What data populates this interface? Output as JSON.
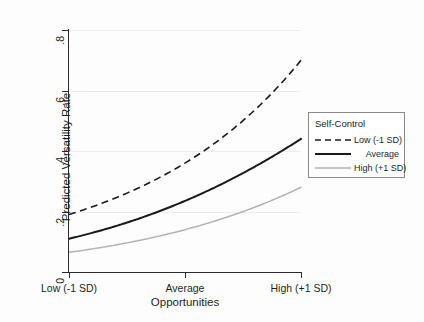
{
  "chart_data": {
    "type": "line",
    "title": "",
    "xlabel": "Opportunities",
    "ylabel": "Predicted Versatility Rate",
    "categories": [
      "Low (-1 SD)",
      "Average",
      "High (+1 SD)"
    ],
    "x": [
      0,
      1,
      2
    ],
    "xlim": [
      0,
      2
    ],
    "ylim": [
      0,
      0.8
    ],
    "yticks": [
      0,
      0.2,
      0.4,
      0.6,
      0.8
    ],
    "ytick_labels": [
      "0",
      ".2",
      ".4",
      ".6",
      ".8"
    ],
    "xtick_labels": [
      "Low (-1 SD)",
      "Average",
      "High (+1 SD)"
    ],
    "grid": "horizontal",
    "legend_position": "right-middle",
    "legend_title": "Self-Control",
    "series": [
      {
        "name": "Low (-1 SD)",
        "style": "dashed",
        "color": "#1a1a1a",
        "width": 1.6,
        "values": [
          0.19,
          0.36,
          0.7
        ]
      },
      {
        "name": "Average",
        "style": "solid",
        "color": "#1a1a1a",
        "width": 2.0,
        "values": [
          0.11,
          0.235,
          0.44
        ]
      },
      {
        "name": "High (+1 SD)",
        "style": "solid",
        "color": "#b3b3b3",
        "width": 1.5,
        "values": [
          0.065,
          0.14,
          0.28
        ]
      }
    ]
  },
  "axes": {
    "y_label": "Predicted Versatility Rate",
    "x_label": "Opportunities",
    "y_ticks": [
      {
        "label": ".8",
        "value": 0.8
      },
      {
        "label": ".6",
        "value": 0.6
      },
      {
        "label": ".4",
        "value": 0.4
      },
      {
        "label": ".2",
        "value": 0.2
      },
      {
        "label": "0",
        "value": 0
      }
    ],
    "x_ticks": [
      {
        "label": "Low (-1 SD)",
        "value": 0
      },
      {
        "label": "Average",
        "value": 1
      },
      {
        "label": "High (+1 SD)",
        "value": 2
      }
    ]
  },
  "legend": {
    "title": "Self-Control",
    "entries": [
      {
        "label": "Low (-1 SD)",
        "style": "dashed",
        "color": "#1a1a1a"
      },
      {
        "label": "Average",
        "style": "solid",
        "color": "#1a1a1a"
      },
      {
        "label": "High (+1 SD)",
        "style": "solid",
        "color": "#b3b3b3"
      }
    ]
  },
  "colors": {
    "background": "#fdfdfd",
    "axis": "#2b2b2b",
    "grid": "#ededed",
    "series_dark": "#1a1a1a",
    "series_light": "#b3b3b3",
    "text": "#1d1d1d"
  }
}
